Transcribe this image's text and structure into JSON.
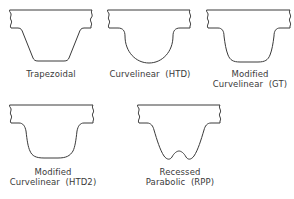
{
  "diagram": {
    "profiles": [
      {
        "id": "trapezoidal",
        "label_lines": [
          "Trapezoidal"
        ]
      },
      {
        "id": "htd",
        "label_lines": [
          "Curvelinear  (HTD)"
        ]
      },
      {
        "id": "gt",
        "label_lines": [
          "Modified",
          "Curvelinear  (GT)"
        ]
      },
      {
        "id": "htd2",
        "label_lines": [
          "Modified",
          "Curvelinear  (HTD2)"
        ]
      },
      {
        "id": "rpp",
        "label_lines": [
          "Recessed",
          "Parabolic  (RPP)"
        ]
      }
    ],
    "colors": {
      "stroke": "#3a3a3a",
      "background": "#ffffff"
    }
  }
}
